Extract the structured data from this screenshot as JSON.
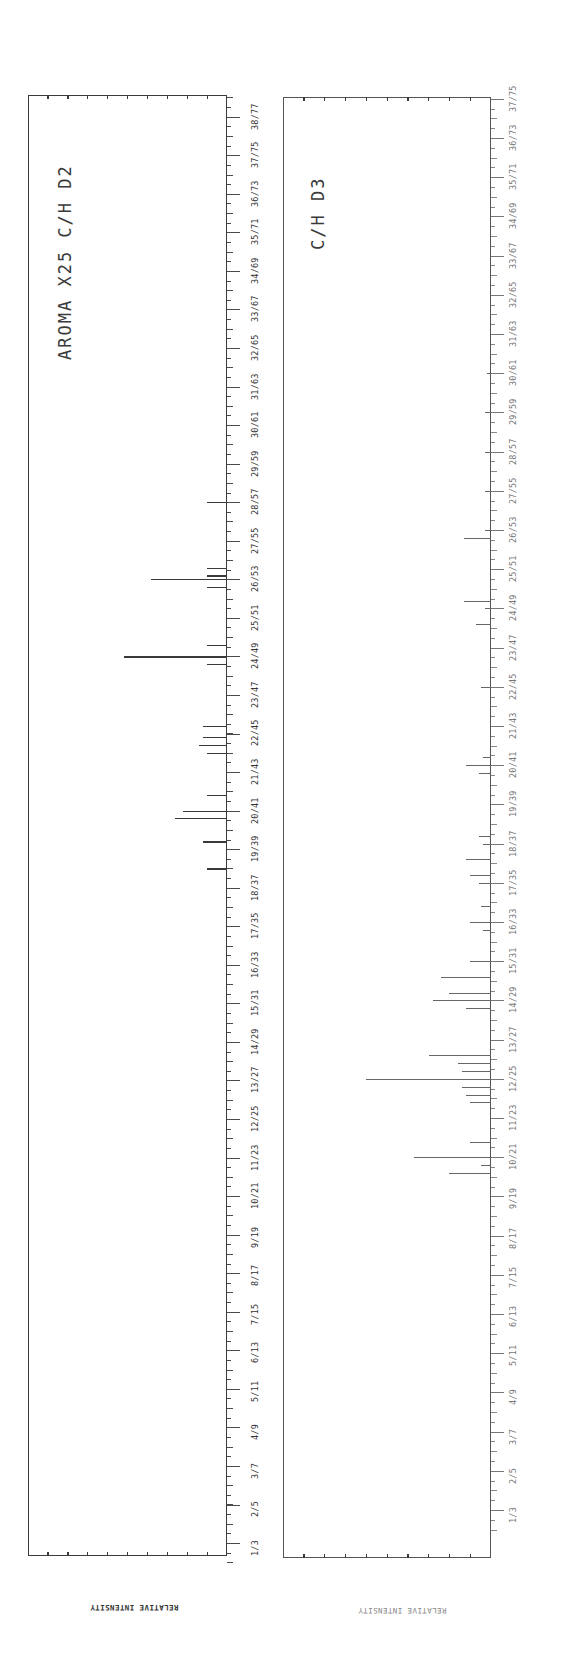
{
  "chart_data": [
    {
      "type": "bar",
      "orientation": "rotated-90 (m/z axis vertical on right, intensity horizontal)",
      "title": "AROMA X25 C/H D2",
      "xlabel": "",
      "ylabel": "RELATIVE INTENSITY",
      "axis_tick_labels": [
        "1/3",
        "2/5",
        "3/7",
        "4/9",
        "5/11",
        "6/13",
        "7/15",
        "8/17",
        "9/19",
        "10/21",
        "11/23",
        "12/25",
        "13/27",
        "14/29",
        "15/31",
        "16/33",
        "17/35",
        "18/37",
        "19/39",
        "20/41",
        "21/43",
        "22/45",
        "23/47",
        "24/49",
        "25/51",
        "26/53",
        "27/55",
        "28/57",
        "29/59",
        "30/61",
        "31/63",
        "32/65",
        "33/67",
        "34/69",
        "35/71",
        "36/73",
        "37/75",
        "38/77"
      ],
      "intensity_ticks": 9,
      "peaks": [
        {
          "position": 18.5,
          "intensity": 0.1
        },
        {
          "position": 19.2,
          "intensity": 0.12
        },
        {
          "position": 19.8,
          "intensity": 0.26
        },
        {
          "position": 20.0,
          "intensity": 0.22
        },
        {
          "position": 20.4,
          "intensity": 0.1
        },
        {
          "position": 21.5,
          "intensity": 0.1
        },
        {
          "position": 21.7,
          "intensity": 0.14
        },
        {
          "position": 21.9,
          "intensity": 0.12
        },
        {
          "position": 22.2,
          "intensity": 0.12
        },
        {
          "position": 23.8,
          "intensity": 0.1
        },
        {
          "position": 24.0,
          "intensity": 0.48
        },
        {
          "position": 24.0,
          "intensity": 0.52
        },
        {
          "position": 24.3,
          "intensity": 0.1
        },
        {
          "position": 25.8,
          "intensity": 0.1
        },
        {
          "position": 26.0,
          "intensity": 0.29
        },
        {
          "position": 26.0,
          "intensity": 0.38
        },
        {
          "position": 26.1,
          "intensity": 0.1
        },
        {
          "position": 26.3,
          "intensity": 0.1
        },
        {
          "position": 28.0,
          "intensity": 0.1
        }
      ]
    },
    {
      "type": "bar",
      "orientation": "rotated-90 (m/z axis vertical on right, intensity horizontal)",
      "title": "C/H D3",
      "xlabel": "",
      "ylabel": "RELATIVE INTENSITY",
      "axis_tick_labels": [
        "1/3",
        "2/5",
        "3/7",
        "4/9",
        "5/11",
        "6/13",
        "7/15",
        "8/17",
        "9/19",
        "10/21",
        "11/23",
        "12/25",
        "13/27",
        "14/29",
        "15/31",
        "16/33",
        "17/35",
        "18/37",
        "19/39",
        "20/41",
        "21/43",
        "22/45",
        "23/47",
        "24/49",
        "25/51",
        "26/53",
        "27/55",
        "28/57",
        "29/59",
        "30/61",
        "31/63",
        "32/65",
        "33/67",
        "34/69",
        "35/71",
        "36/73",
        "37/75"
      ],
      "intensity_ticks": 9,
      "peaks": [
        {
          "position": 9.6,
          "intensity": 0.2
        },
        {
          "position": 9.8,
          "intensity": 0.05
        },
        {
          "position": 10.0,
          "intensity": 0.37
        },
        {
          "position": 10.4,
          "intensity": 0.1
        },
        {
          "position": 11.4,
          "intensity": 0.1
        },
        {
          "position": 11.6,
          "intensity": 0.12
        },
        {
          "position": 11.8,
          "intensity": 0.14
        },
        {
          "position": 12.0,
          "intensity": 0.6
        },
        {
          "position": 12.2,
          "intensity": 0.14
        },
        {
          "position": 12.4,
          "intensity": 0.16
        },
        {
          "position": 12.6,
          "intensity": 0.3
        },
        {
          "position": 13.8,
          "intensity": 0.12
        },
        {
          "position": 14.0,
          "intensity": 0.28
        },
        {
          "position": 14.2,
          "intensity": 0.2
        },
        {
          "position": 14.6,
          "intensity": 0.24
        },
        {
          "position": 15.0,
          "intensity": 0.1
        },
        {
          "position": 15.8,
          "intensity": 0.04
        },
        {
          "position": 16.0,
          "intensity": 0.1
        },
        {
          "position": 16.4,
          "intensity": 0.05
        },
        {
          "position": 17.0,
          "intensity": 0.06
        },
        {
          "position": 17.2,
          "intensity": 0.1
        },
        {
          "position": 17.6,
          "intensity": 0.12
        },
        {
          "position": 18.0,
          "intensity": 0.04
        },
        {
          "position": 18.2,
          "intensity": 0.06
        },
        {
          "position": 19.8,
          "intensity": 0.06
        },
        {
          "position": 20.0,
          "intensity": 0.12
        },
        {
          "position": 20.2,
          "intensity": 0.04
        },
        {
          "position": 22.0,
          "intensity": 0.05
        },
        {
          "position": 23.6,
          "intensity": 0.07
        },
        {
          "position": 24.0,
          "intensity": 0.03
        },
        {
          "position": 24.2,
          "intensity": 0.13
        },
        {
          "position": 25.8,
          "intensity": 0.13
        },
        {
          "position": 26.0,
          "intensity": 0.03
        },
        {
          "position": 27.0,
          "intensity": 0.03
        },
        {
          "position": 28.0,
          "intensity": 0.03
        },
        {
          "position": 29.0,
          "intensity": 0.03
        },
        {
          "position": 30.0,
          "intensity": 0.02
        }
      ]
    }
  ],
  "charts": {
    "left": {
      "title": "AROMA X25 C/H D2",
      "ylabel": "RELATIVE INTENSITY"
    },
    "right": {
      "title": "C/H D3",
      "ylabel": "RELATIVE INTENSITY"
    }
  }
}
